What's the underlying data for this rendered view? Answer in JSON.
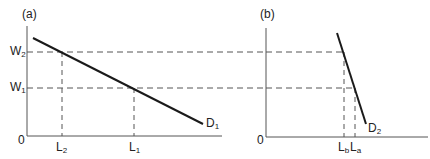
{
  "panels": [
    {
      "id": "a",
      "label": "(a)",
      "origin": "0",
      "wage_labels": [
        {
          "main": "W",
          "sub": "2"
        },
        {
          "main": "W",
          "sub": "1"
        }
      ],
      "labour_labels": [
        {
          "main": "L",
          "sub": "2"
        },
        {
          "main": "L",
          "sub": "1"
        }
      ],
      "curve_label": {
        "main": "D",
        "sub": "1"
      }
    },
    {
      "id": "b",
      "label": "(b)",
      "origin": "0",
      "labour_labels": [
        {
          "main": "L",
          "sub": "b"
        },
        {
          "main": "L",
          "sub": "a"
        }
      ],
      "curve_label": {
        "main": "D",
        "sub": "2"
      }
    }
  ],
  "colors": {
    "line": "#1a1a1a",
    "axis": "#444444",
    "dash": "#555555"
  }
}
